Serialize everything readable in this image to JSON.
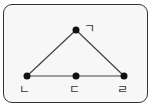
{
  "diagram": {
    "type": "triangle-graph",
    "points": [
      {
        "id": "top",
        "label": "ㄱ",
        "x": 76,
        "y": 30
      },
      {
        "id": "left",
        "label": "ㄴ",
        "x": 27,
        "y": 76
      },
      {
        "id": "middle",
        "label": "ㄷ",
        "x": 76,
        "y": 76
      },
      {
        "id": "right",
        "label": "ㄹ",
        "x": 124,
        "y": 76
      }
    ],
    "edges": [
      [
        "top",
        "left"
      ],
      [
        "top",
        "right"
      ],
      [
        "left",
        "middle"
      ],
      [
        "middle",
        "right"
      ]
    ],
    "labels": {
      "top": "ㄱ",
      "left": "ㄴ",
      "middle": "ㄷ",
      "right": "ㄹ"
    },
    "colors": {
      "line": "#444444",
      "point": "#111111",
      "border": "#333333",
      "background": "#f7f7f7"
    }
  }
}
